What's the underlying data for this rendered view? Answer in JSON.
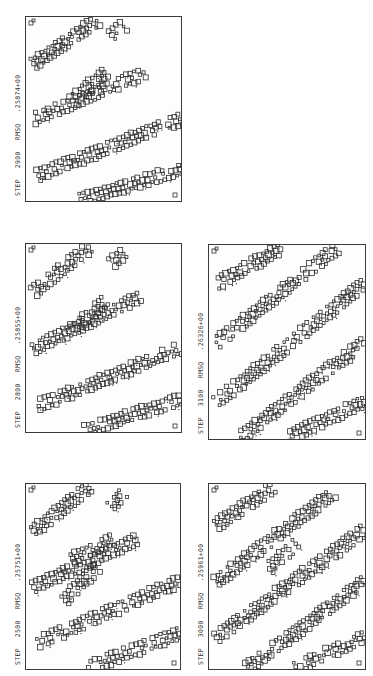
{
  "figure": {
    "orientation": "rotated-90",
    "panels": [
      {
        "id": "p2900",
        "step_label": "STEP",
        "step": "2900",
        "rmsq_label": "RMSQ",
        "rmsq": ".25874+00",
        "frame": {
          "x": 25,
          "y": 16,
          "w": 157,
          "h": 186
        },
        "label_pos": {
          "x": 14,
          "y": 196
        },
        "stripes": [
          [
            0.05,
            0.25,
            0.45,
            0.02
          ],
          [
            0.05,
            0.55,
            0.75,
            0.3
          ],
          [
            0.08,
            0.85,
            0.98,
            0.55
          ],
          [
            0.35,
            0.98,
            0.98,
            0.82
          ],
          [
            0.55,
            0.1,
            0.62,
            0.05
          ],
          [
            0.3,
            0.45,
            0.5,
            0.3
          ]
        ]
      },
      {
        "id": "p2800",
        "step_label": "STEP",
        "step": "2800",
        "rmsq_label": "RMSQ",
        "rmsq": ".25855+00",
        "frame": {
          "x": 25,
          "y": 243,
          "w": 157,
          "h": 190
        },
        "label_pos": {
          "x": 14,
          "y": 428
        },
        "stripes": [
          [
            0.05,
            0.25,
            0.4,
            0.02
          ],
          [
            0.05,
            0.55,
            0.72,
            0.28
          ],
          [
            0.08,
            0.85,
            0.98,
            0.55
          ],
          [
            0.38,
            0.98,
            0.98,
            0.82
          ],
          [
            0.55,
            0.1,
            0.62,
            0.05
          ],
          [
            0.3,
            0.45,
            0.5,
            0.3
          ]
        ]
      },
      {
        "id": "p2500",
        "step_label": "STEP",
        "step": "2500",
        "rmsq_label": "RMSQ",
        "rmsq": ".25751+00",
        "frame": {
          "x": 25,
          "y": 483,
          "w": 156,
          "h": 187
        },
        "label_pos": {
          "x": 14,
          "y": 665
        },
        "stripes": [
          [
            0.05,
            0.25,
            0.4,
            0.02
          ],
          [
            0.05,
            0.55,
            0.7,
            0.3
          ],
          [
            0.08,
            0.85,
            0.98,
            0.52
          ],
          [
            0.4,
            0.98,
            0.98,
            0.8
          ],
          [
            0.55,
            0.12,
            0.62,
            0.05
          ],
          [
            0.3,
            0.4,
            0.55,
            0.3
          ],
          [
            0.25,
            0.62,
            0.45,
            0.45
          ]
        ]
      },
      {
        "id": "p3100",
        "step_label": "STEP",
        "step": "3100",
        "rmsq_label": "RMSQ",
        "rmsq": ".26326+00",
        "frame": {
          "x": 208,
          "y": 244,
          "w": 158,
          "h": 196
        },
        "label_pos": {
          "x": 197,
          "y": 434
        },
        "stripes": [
          [
            0.05,
            0.2,
            0.45,
            0.02
          ],
          [
            0.05,
            0.5,
            0.8,
            0.02
          ],
          [
            0.05,
            0.8,
            0.98,
            0.2
          ],
          [
            0.2,
            0.98,
            0.98,
            0.5
          ],
          [
            0.5,
            0.98,
            0.98,
            0.8
          ]
        ]
      },
      {
        "id": "p3000",
        "step_label": "STEP",
        "step": "3000",
        "rmsq_label": "RMSQ",
        "rmsq": ".25961+00",
        "frame": {
          "x": 208,
          "y": 483,
          "w": 158,
          "h": 187
        },
        "label_pos": {
          "x": 197,
          "y": 665
        },
        "stripes": [
          [
            0.05,
            0.22,
            0.4,
            0.02
          ],
          [
            0.05,
            0.52,
            0.78,
            0.05
          ],
          [
            0.05,
            0.82,
            0.98,
            0.25
          ],
          [
            0.25,
            0.98,
            0.98,
            0.52
          ],
          [
            0.55,
            0.98,
            0.98,
            0.82
          ],
          [
            0.38,
            0.45,
            0.55,
            0.32
          ]
        ]
      }
    ]
  },
  "colors": {
    "ink": "#2e2e2e",
    "paper": "#ffffff"
  }
}
